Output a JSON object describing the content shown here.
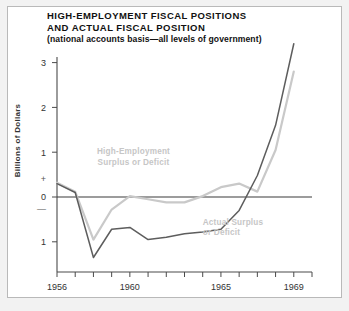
{
  "chart_data": {
    "type": "line",
    "title": "HIGH-EMPLOYMENT FISCAL POSITIONS AND ACTUAL FISCAL POSITION",
    "title_lines": [
      "HIGH-EMPLOYMENT FISCAL POSITIONS",
      "AND ACTUAL FISCAL POSITION"
    ],
    "subtitle": "(national accounts basis—all levels of government)",
    "xlabel": "",
    "ylabel": "Billions of Dollars",
    "xlim": [
      1956,
      1970
    ],
    "ylim": [
      -1.5,
      3.6
    ],
    "grid": false,
    "legend_position": "inline-annotation",
    "x_ticks": [
      1956,
      1957,
      1958,
      1959,
      1960,
      1961,
      1962,
      1963,
      1964,
      1965,
      1966,
      1967,
      1968,
      1969,
      1970
    ],
    "x_tick_labels": [
      "1956",
      "",
      "",
      "",
      "1960",
      "",
      "",
      "",
      "",
      "1965",
      "",
      "",
      "",
      "1969",
      ""
    ],
    "y_ticks": [
      -1,
      0,
      1,
      2,
      3
    ],
    "y_tick_labels": [
      "1",
      "0",
      "1",
      "2",
      "3"
    ],
    "y_sign_positive": "+",
    "y_sign_negative": "—",
    "annotations": [
      {
        "name": "high-employment-label",
        "lines": [
          "High-Employment",
          "Surplus or Deficit"
        ],
        "x": 1960.2,
        "y": 0.95
      },
      {
        "name": "actual-label",
        "lines": [
          "Actual Surplus",
          "or Deficit"
        ],
        "x": 1964.0,
        "y": -0.62
      }
    ],
    "series": [
      {
        "name": "High-Employment Surplus or Deficit",
        "color": "#c9c9c9",
        "x": [
          1956,
          1957,
          1958,
          1959,
          1960,
          1961,
          1962,
          1963,
          1964,
          1965,
          1966,
          1967,
          1968,
          1969
        ],
        "values": [
          0.32,
          0.12,
          -0.95,
          -0.28,
          0.02,
          -0.05,
          -0.12,
          -0.12,
          0.02,
          0.22,
          0.3,
          0.12,
          1.05,
          2.8
        ]
      },
      {
        "name": "Actual Surplus or Deficit",
        "color": "#5d5d5d",
        "x": [
          1956,
          1957,
          1958,
          1959,
          1960,
          1961,
          1962,
          1963,
          1964,
          1965,
          1966,
          1967,
          1968,
          1969
        ],
        "values": [
          0.3,
          0.1,
          -1.35,
          -0.72,
          -0.68,
          -0.95,
          -0.9,
          -0.82,
          -0.78,
          -0.72,
          -0.3,
          0.48,
          1.6,
          3.42
        ]
      }
    ]
  }
}
